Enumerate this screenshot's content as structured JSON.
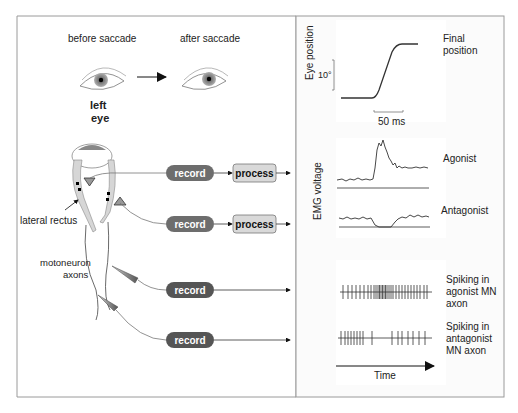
{
  "left_panel": {
    "before_label": "before saccade",
    "after_label": "after saccade",
    "eye_label_line1": "left",
    "eye_label_line2": "eye",
    "muscle_label": "lateral rectus",
    "axon_label_line1": "motoneuron",
    "axon_label_line2": "axons",
    "pipelines": [
      {
        "record": "record",
        "process": "process"
      },
      {
        "record": "record",
        "process": "process"
      },
      {
        "record": "record"
      },
      {
        "record": "record"
      }
    ]
  },
  "right_panel": {
    "eye_position": {
      "ylabel": "Eye position",
      "scale_y": "10°",
      "scale_x": "50 ms",
      "annotation_line1": "Final",
      "annotation_line2": "position"
    },
    "emg": {
      "ylabel": "EMG voltage",
      "agonist": "Agonist",
      "antagonist": "Antagonist"
    },
    "spikes": {
      "agonist_line1": "Spiking in",
      "agonist_line2": "agonist MN",
      "agonist_line3": "axon",
      "antagonist_line1": "Spiking in",
      "antagonist_line2": "antagonist",
      "antagonist_line3": "MN axon",
      "time_label": "Time"
    }
  },
  "colors": {
    "record_fill": "#6d6d6d",
    "process_fill": "#d9d9d9",
    "frame": "#9a9a9a",
    "trace": "#333333"
  }
}
